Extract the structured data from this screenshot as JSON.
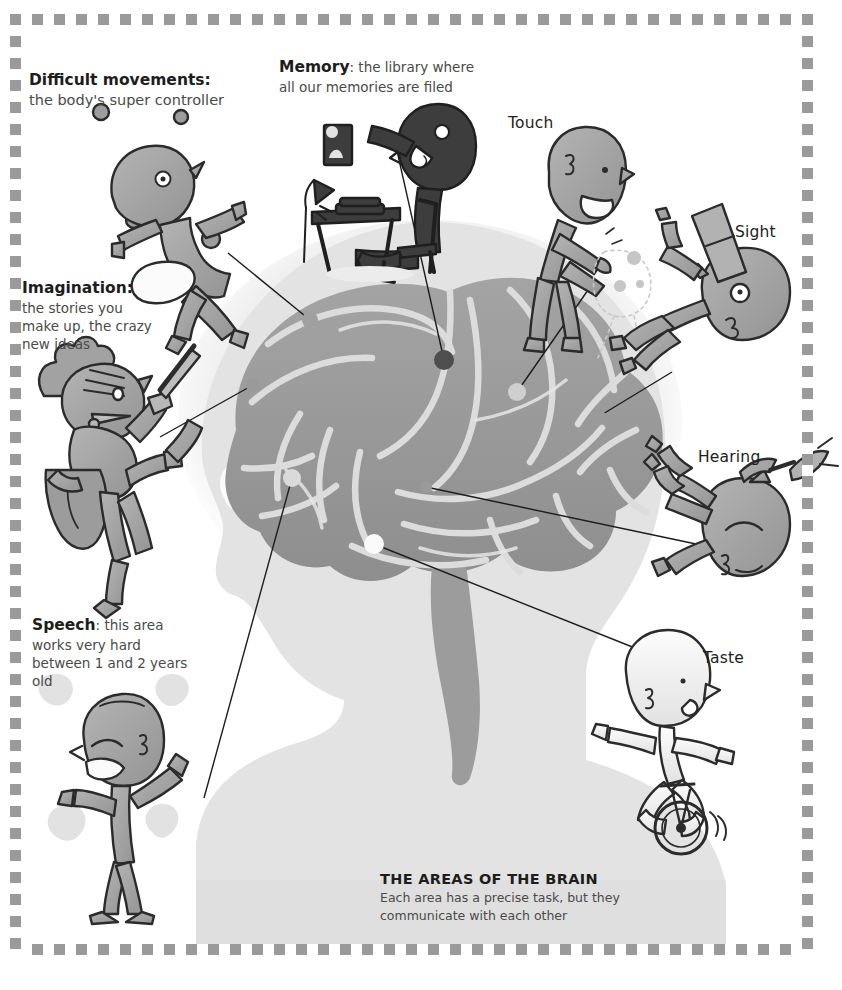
{
  "poster": {
    "caption_title": "THE AREAS OF THE BRAIN",
    "caption_subtitle": "Each area has a precise task, but they communicate with each other"
  },
  "labels": {
    "difficult_movements": {
      "heading": "Difficult movements",
      "separator": ":",
      "body": "the body's super controller"
    },
    "memory": {
      "heading": "Memory",
      "separator": ":",
      "body": "the library where all our memories are filed"
    },
    "imagination": {
      "heading": "Imagination",
      "separator": ":",
      "body": "the stories you make up, the crazy new ideas"
    },
    "speech": {
      "heading": "Speech",
      "separator": ":",
      "body": "this area works very hard between 1 and 2 years old"
    },
    "touch": {
      "heading": "Touch"
    },
    "sight": {
      "heading": "Sight"
    },
    "hearing": {
      "heading": "Hearing"
    },
    "taste": {
      "heading": "Taste"
    }
  },
  "colors": {
    "page_background": "#ffffff",
    "frame_checker": "#9a9a9a",
    "head_silhouette": "#e3e3e3",
    "head_halo": "#ededed",
    "brain_body": "#9c9c9c",
    "brain_sulci": "#d8d8d8",
    "character_mid": "#a8a8a8",
    "character_dark": "#4a4a4a",
    "character_light": "#f3f3f3",
    "ink": "#1d1d1b",
    "body_text": "#4a4a48",
    "leader_line": "#1d1d1b"
  },
  "brain_markers": [
    {
      "area": "difficult-movements",
      "tone": "mid",
      "x": 310,
      "y": 320
    },
    {
      "area": "memory",
      "tone": "dark",
      "x": 444,
      "y": 360
    },
    {
      "area": "touch",
      "tone": "light",
      "x": 517,
      "y": 392
    },
    {
      "area": "imagination",
      "tone": "mid",
      "x": 253,
      "y": 385
    },
    {
      "area": "sight",
      "tone": "mid",
      "x": 598,
      "y": 417
    },
    {
      "area": "hearing",
      "tone": "mid",
      "x": 426,
      "y": 487
    },
    {
      "area": "speech",
      "tone": "light",
      "x": 292,
      "y": 478
    },
    {
      "area": "taste",
      "tone": "white",
      "x": 374,
      "y": 544
    }
  ],
  "characters": [
    {
      "name": "juggler",
      "area": "difficult-movements",
      "icon": "running-juggler-figure"
    },
    {
      "name": "reader",
      "area": "memory",
      "icon": "figure-at-desk-with-photo"
    },
    {
      "name": "toucher",
      "area": "touch",
      "icon": "figure-touching-figure"
    },
    {
      "name": "stargazer",
      "area": "sight",
      "icon": "figure-with-telescope"
    },
    {
      "name": "knight",
      "area": "imagination",
      "icon": "knight-with-sword-and-shield"
    },
    {
      "name": "trumpeter",
      "area": "hearing",
      "icon": "figure-with-trumpet"
    },
    {
      "name": "shouter",
      "area": "speech",
      "icon": "figure-shouting"
    },
    {
      "name": "unicyclist",
      "area": "taste",
      "icon": "figure-on-unicycle"
    }
  ]
}
